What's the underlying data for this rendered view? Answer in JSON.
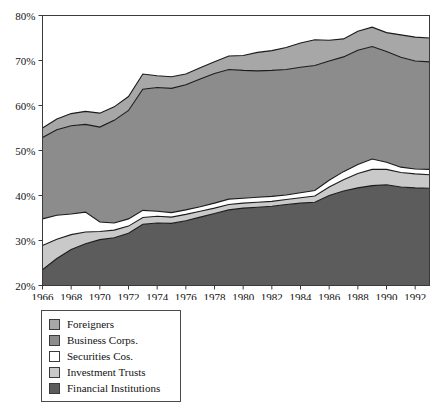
{
  "chart_data": {
    "type": "area",
    "stacked": true,
    "title": "",
    "subtitle": "",
    "xlabel": "",
    "ylabel": "",
    "grid": false,
    "legend_position": "below-left",
    "xlim": [
      1966,
      1993
    ],
    "ylim": [
      20,
      80
    ],
    "ytick_labels": [
      "20%",
      "30%",
      "40%",
      "50%",
      "60%",
      "70%",
      "80%"
    ],
    "ytick_values": [
      20,
      30,
      40,
      50,
      60,
      70,
      80
    ],
    "xtick_labels": [
      "1966",
      "1968",
      "1970",
      "1972",
      "1974",
      "1976",
      "1978",
      "1980",
      "1982",
      "1984",
      "1986",
      "1988",
      "1990",
      "1992"
    ],
    "xtick_values": [
      1966,
      1968,
      1970,
      1972,
      1974,
      1976,
      1978,
      1980,
      1982,
      1984,
      1986,
      1988,
      1990,
      1992
    ],
    "x": [
      1966,
      1967,
      1968,
      1969,
      1970,
      1971,
      1972,
      1973,
      1974,
      1975,
      1976,
      1977,
      1978,
      1979,
      1980,
      1981,
      1982,
      1983,
      1984,
      1985,
      1986,
      1987,
      1988,
      1989,
      1990,
      1991,
      1992,
      1993
    ],
    "series": [
      {
        "name": "Financial Institutions",
        "color": "#5c5c5c",
        "values": [
          23.5,
          26.0,
          28.0,
          29.3,
          30.2,
          30.6,
          31.6,
          33.6,
          33.9,
          33.8,
          34.4,
          35.2,
          36.0,
          36.8,
          37.2,
          37.4,
          37.6,
          38.0,
          38.3,
          38.5,
          40.0,
          41.0,
          41.7,
          42.2,
          42.4,
          41.9,
          41.7,
          41.6
        ]
      },
      {
        "name": "Investment Trusts",
        "color": "#c9c9c9",
        "values": [
          5.4,
          4.3,
          3.3,
          2.6,
          1.8,
          1.7,
          1.6,
          1.5,
          1.5,
          1.4,
          1.4,
          1.3,
          1.2,
          1.2,
          1.1,
          1.1,
          1.1,
          1.1,
          1.2,
          1.4,
          1.9,
          2.5,
          3.2,
          3.6,
          3.4,
          3.2,
          3.1,
          3.0
        ]
      },
      {
        "name": "Securities Cos.",
        "color": "#ffffff",
        "values": [
          5.9,
          5.3,
          4.6,
          4.4,
          2.1,
          1.6,
          1.6,
          1.6,
          1.1,
          1.0,
          1.0,
          1.0,
          1.1,
          1.2,
          1.1,
          1.1,
          1.1,
          1.0,
          1.1,
          1.2,
          1.5,
          1.8,
          2.0,
          2.3,
          1.6,
          1.2,
          1.1,
          1.2
        ]
      },
      {
        "name": "Business Corps.",
        "color": "#8c8c8c",
        "values": [
          18.1,
          19.0,
          19.6,
          19.5,
          21.1,
          22.8,
          24.1,
          26.9,
          27.5,
          27.6,
          27.8,
          28.4,
          28.8,
          28.8,
          28.4,
          28.1,
          28.0,
          27.9,
          27.9,
          27.8,
          26.5,
          25.5,
          25.4,
          25.0,
          24.6,
          24.4,
          24.0,
          23.9
        ]
      },
      {
        "name": "Foreigners",
        "color": "#a7a7a7",
        "values": [
          2.1,
          2.4,
          2.7,
          2.9,
          3.1,
          3.0,
          3.1,
          3.4,
          2.6,
          2.6,
          2.4,
          2.5,
          2.6,
          3.0,
          3.3,
          4.1,
          4.4,
          4.9,
          5.4,
          5.7,
          4.6,
          4.0,
          4.2,
          4.3,
          4.2,
          5.0,
          5.3,
          5.3
        ]
      }
    ],
    "cumulative_tops": {
      "financial_institutions": [
        23.5,
        26.0,
        28.0,
        29.3,
        30.2,
        30.6,
        31.6,
        33.6,
        33.9,
        33.8,
        34.4,
        35.2,
        36.0,
        36.8,
        37.2,
        37.4,
        37.6,
        38.0,
        38.3,
        38.5,
        40.0,
        41.0,
        41.7,
        42.2,
        42.4,
        41.9,
        41.7,
        41.6
      ],
      "investment_trusts": [
        28.9,
        30.3,
        31.3,
        31.9,
        32.0,
        32.3,
        33.2,
        35.1,
        35.4,
        35.2,
        35.8,
        36.5,
        37.2,
        38.0,
        38.3,
        38.5,
        38.7,
        39.1,
        39.5,
        39.9,
        41.9,
        43.5,
        44.9,
        45.8,
        45.8,
        45.1,
        44.8,
        44.6
      ],
      "securities_cos": [
        34.8,
        35.6,
        35.9,
        36.3,
        34.1,
        33.9,
        34.8,
        36.7,
        36.5,
        36.2,
        36.8,
        37.5,
        38.3,
        39.2,
        39.4,
        39.6,
        39.8,
        40.1,
        40.6,
        41.1,
        43.4,
        45.3,
        46.9,
        48.1,
        47.4,
        46.3,
        45.9,
        45.8
      ],
      "business_corps": [
        52.9,
        54.6,
        55.5,
        55.8,
        55.2,
        56.7,
        58.9,
        63.6,
        64.0,
        63.8,
        64.6,
        65.9,
        67.1,
        68.0,
        67.8,
        67.7,
        67.8,
        68.0,
        68.5,
        68.9,
        69.9,
        70.8,
        72.3,
        73.1,
        72.0,
        70.7,
        69.9,
        69.7
      ],
      "foreigners": [
        55.0,
        57.0,
        58.2,
        58.7,
        58.3,
        59.7,
        62.0,
        67.0,
        66.6,
        66.4,
        67.0,
        68.4,
        69.7,
        71.0,
        71.1,
        71.8,
        72.2,
        72.9,
        73.9,
        74.6,
        74.5,
        74.8,
        76.5,
        77.4,
        76.2,
        75.7,
        75.2,
        75.0
      ]
    }
  },
  "legend": {
    "items": [
      {
        "label": "Foreigners",
        "color": "#a7a7a7"
      },
      {
        "label": "Business Corps.",
        "color": "#8c8c8c"
      },
      {
        "label": "Securities Cos.",
        "color": "#ffffff"
      },
      {
        "label": "Investment Trusts",
        "color": "#c9c9c9"
      },
      {
        "label": "Financial Institutions",
        "color": "#5c5c5c"
      }
    ]
  }
}
